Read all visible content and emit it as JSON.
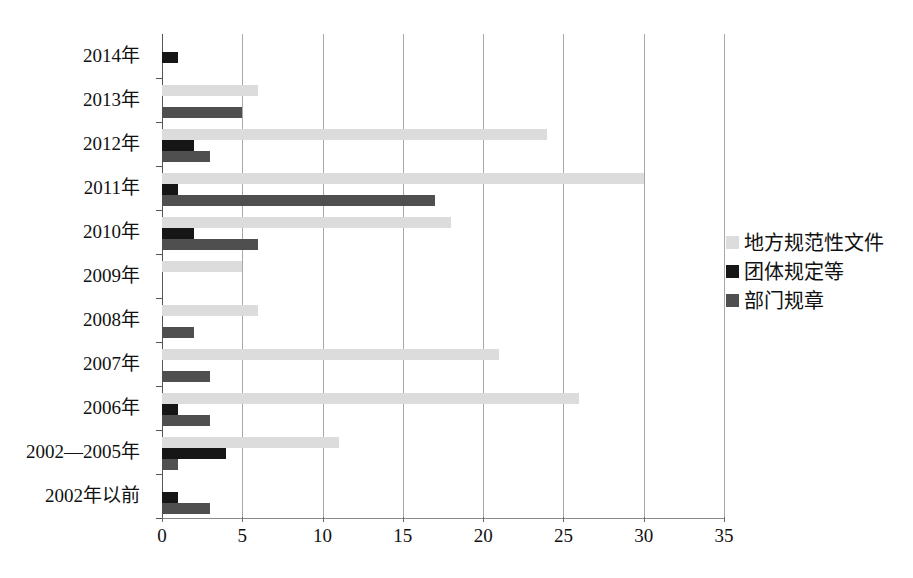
{
  "chart_data": {
    "type": "bar",
    "orientation": "horizontal",
    "title": "",
    "xlabel": "",
    "ylabel": "",
    "xlim": [
      0,
      35
    ],
    "xticks": [
      0,
      5,
      10,
      15,
      20,
      25,
      30,
      35
    ],
    "grid": "vertical",
    "legend_position": "right",
    "categories": [
      "2014年",
      "2013年",
      "2012年",
      "2011年",
      "2010年",
      "2009年",
      "2008年",
      "2007年",
      "2006年",
      "2002—2005年",
      "2002年以前"
    ],
    "series": [
      {
        "name": "地方规范性文件",
        "color": "#dcdcdc",
        "values": [
          0,
          6,
          24,
          30,
          18,
          5,
          6,
          21,
          26,
          11,
          0
        ]
      },
      {
        "name": "团体规定等",
        "color": "#161616",
        "values": [
          1,
          0,
          2,
          1,
          2,
          0,
          0,
          0,
          1,
          4,
          1
        ]
      },
      {
        "name": "部门规章",
        "color": "#4f4f4f",
        "values": [
          0,
          5,
          3,
          17,
          6,
          0,
          2,
          3,
          3,
          1,
          3
        ]
      }
    ]
  },
  "legend": {
    "items": [
      {
        "label": "地方规范性文件",
        "swatch": "#dcdcdc",
        "icon": "legend-swatch-icon"
      },
      {
        "label": "团体规定等",
        "swatch": "#161616",
        "icon": "legend-swatch-icon"
      },
      {
        "label": "部门规章",
        "swatch": "#4f4f4f",
        "icon": "legend-swatch-icon"
      }
    ]
  },
  "colors": {
    "series_light_gray": "#dcdcdc",
    "series_black": "#161616",
    "series_dark_gray": "#4f4f4f",
    "gridline": "#a8a8a8",
    "axis": "#555555",
    "background": "#ffffff"
  }
}
